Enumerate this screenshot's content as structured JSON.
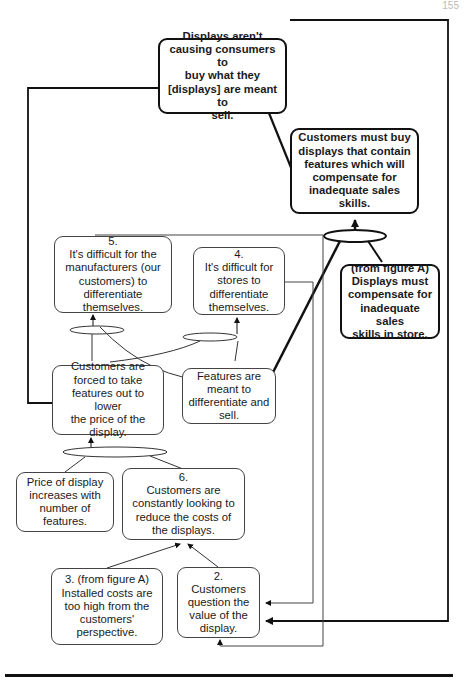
{
  "page_number": "155",
  "nodes": {
    "top": "Displays aren't\ncausing consumers to\nbuy what they\n[displays] are meant to\nsell.",
    "must_buy": "Customers must buy\ndisplays that contain\nfeatures which will\ncompensate for\ninadequate sales\nskills.",
    "fig_a_displays": "(from figure A)\nDisplays must\ncompensate for\ninadequate sales\nskills in store.",
    "n5": "5.\nIt's difficult for the\nmanufacturers (our\ncustomers) to\ndifferentiate\nthemselves.",
    "n4": "4.\nIt's difficult for\nstores to\ndifferentiate\nthemselves.",
    "forced": "Customers are\nforced to take\nfeatures out to lower\nthe price of the\ndisplay.",
    "features": "Features are\nmeant to\ndifferentiate and\nsell.",
    "price": "Price of display\nincreases with\nnumber of\nfeatures.",
    "n6": "6.\nCustomers are\nconstantly looking to\nreduce the costs of\nthe displays.",
    "n3": "3. (from figure A)\nInstalled costs are\ntoo high from the\ncustomers'\nperspective.",
    "n2": "2.\nCustomers\nquestion the\nvalue of the\ndisplay."
  }
}
